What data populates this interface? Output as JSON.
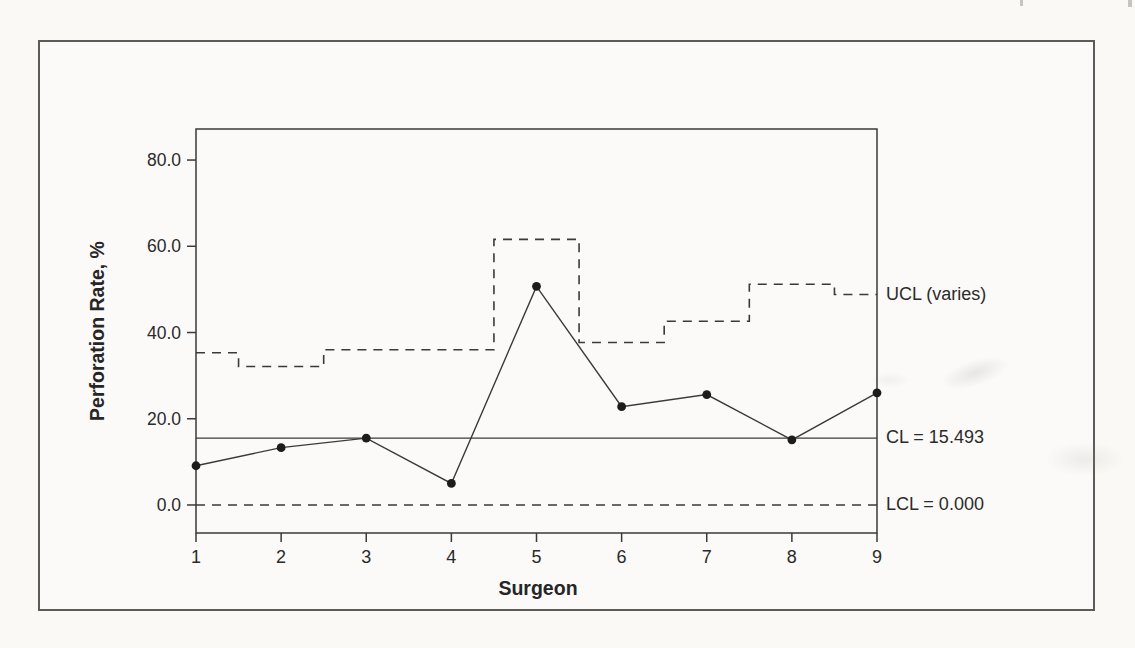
{
  "chart_data": {
    "type": "line",
    "subtype": "p-control-chart",
    "title": "",
    "xlabel": "Surgeon",
    "ylabel": "Perforation Rate, %",
    "x": [
      1,
      2,
      3,
      4,
      5,
      6,
      7,
      8,
      9
    ],
    "series": [
      {
        "name": "Perforation rate",
        "style": "solid line with filled markers",
        "values": [
          9.1,
          13.3,
          15.5,
          5.0,
          50.7,
          22.8,
          25.6,
          15.1,
          26.0
        ]
      },
      {
        "name": "UCL (varies)",
        "style": "dashed stepped line",
        "values": [
          35.3,
          32.1,
          36.0,
          36.0,
          61.6,
          37.7,
          42.6,
          51.2,
          48.8
        ]
      }
    ],
    "reference_lines": [
      {
        "name": "CL",
        "value": 15.493,
        "style": "solid",
        "label": "CL = 15.493"
      },
      {
        "name": "LCL",
        "value": 0.0,
        "style": "dashed",
        "label": "LCL = 0.000"
      }
    ],
    "ucl_annotation": "UCL (varies)",
    "y_ticks": [
      {
        "label": "0.0",
        "value": 0
      },
      {
        "label": "20.0",
        "value": 20
      },
      {
        "label": "40.0",
        "value": 40
      },
      {
        "label": "60.0",
        "value": 60
      },
      {
        "label": "80.0",
        "value": 80
      }
    ],
    "x_ticks": [
      {
        "label": "1",
        "value": 1
      },
      {
        "label": "2",
        "value": 2
      },
      {
        "label": "3",
        "value": 3
      },
      {
        "label": "4",
        "value": 4
      },
      {
        "label": "5",
        "value": 5
      },
      {
        "label": "6",
        "value": 6
      },
      {
        "label": "7",
        "value": 7
      },
      {
        "label": "8",
        "value": 8
      },
      {
        "label": "9",
        "value": 9
      }
    ],
    "ylim": [
      -6.5,
      87.2
    ],
    "xlim": [
      1,
      9
    ],
    "grid": false,
    "legend_position": "annotations at right edge of plot"
  },
  "colors": {
    "ink": "#2e2e2e",
    "line": "#3a3a38",
    "paper": "#fbfaf8",
    "frame": "#5b5b59"
  }
}
